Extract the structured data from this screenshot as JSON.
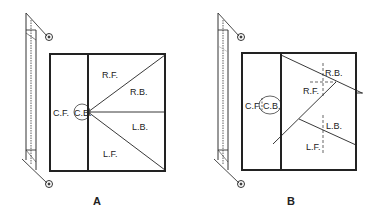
{
  "figures": [
    {
      "caption": "A",
      "labels": {
        "rf": "R.F.",
        "rb": "R.B.",
        "cf": "C.F.",
        "cb": "C.B.",
        "lb": "L.B.",
        "lf": "L.F."
      }
    },
    {
      "caption": "B",
      "labels": {
        "rb": "R.B.",
        "rf": "R.F.",
        "cf": "C.F.",
        "cb": "C.B.",
        "lb": "L.B.",
        "lf": "L.F."
      }
    }
  ],
  "colors": {
    "stroke": "#222222",
    "background": "#ffffff"
  }
}
